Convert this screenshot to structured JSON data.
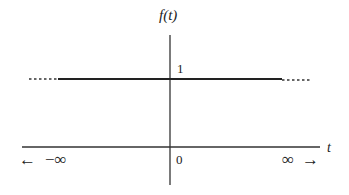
{
  "diagram": {
    "y_axis_label": "f(t)",
    "x_axis_label": "t",
    "level_label": "1",
    "origin_label": "0",
    "left_label": "−∞",
    "right_label": "∞",
    "left_arrow": "←",
    "right_arrow": "→",
    "line_color": "#222222",
    "function": {
      "value": 1,
      "domain": [
        "-∞",
        "∞"
      ],
      "style": "solid with dotted extensions"
    }
  }
}
